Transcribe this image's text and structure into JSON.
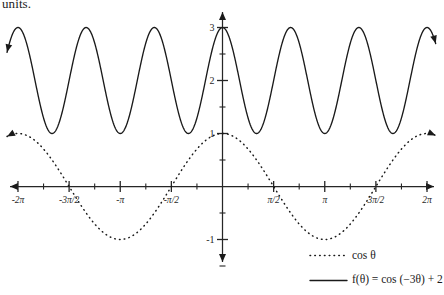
{
  "caption": {
    "text_fragment": "units."
  },
  "chart_data": {
    "type": "line",
    "title": "",
    "xlabel": "",
    "ylabel": "",
    "xlim": [
      -6.283185307179586,
      6.283185307179586
    ],
    "ylim": [
      -1.45,
      3.45
    ],
    "grid": false,
    "legend_position": "bottom-right",
    "x_tick_labels": [
      "-2π",
      "-3π/2",
      "-π",
      "-π/2",
      "π/2",
      "π",
      "3π/2",
      "2π"
    ],
    "x_tick_values": [
      -6.283185307,
      -4.71238898,
      -3.141592654,
      -1.570796327,
      1.570796327,
      3.141592654,
      4.71238898,
      6.283185307
    ],
    "x_minor_tick_values": [
      -5.497787144,
      -3.926990817,
      -2.35619449,
      -0.785398163,
      0.785398163,
      2.35619449,
      3.926990817,
      5.497787144
    ],
    "y_tick_labels": [
      "3",
      "2",
      "1",
      "-1"
    ],
    "y_tick_values": [
      3,
      2,
      1,
      -1
    ],
    "y_minor_tick_values": [
      2.5,
      1.5,
      0.5,
      -0.5,
      -1.5
    ],
    "series": [
      {
        "name": "cos θ",
        "expression": "cos(θ)",
        "style": "dotted",
        "color": "#1a1a1a",
        "amplitude": 1,
        "frequency": 1,
        "vertical_shift": 0,
        "ymin": -1,
        "ymax": 1,
        "period": 6.283185307,
        "key_points": [
          {
            "x": -6.283185307,
            "y": 1
          },
          {
            "x": -4.71238898,
            "y": 0
          },
          {
            "x": -3.141592654,
            "y": -1
          },
          {
            "x": -1.570796327,
            "y": 0
          },
          {
            "x": 0,
            "y": 1
          },
          {
            "x": 1.570796327,
            "y": 0
          },
          {
            "x": 3.141592654,
            "y": -1
          },
          {
            "x": 4.71238898,
            "y": 0
          },
          {
            "x": 6.283185307,
            "y": 1
          }
        ]
      },
      {
        "name": "f(θ) = cos (-3θ) + 2",
        "expression": "cos(-3θ) + 2",
        "style": "solid",
        "color": "#1a1a1a",
        "amplitude": 1,
        "frequency": 3,
        "vertical_shift": 2,
        "ymin": 1,
        "ymax": 3,
        "period": 2.094395102,
        "key_points": [
          {
            "x": -6.283185307,
            "y": 3
          },
          {
            "x": -5.235987756,
            "y": 1
          },
          {
            "x": -4.188790205,
            "y": 3
          },
          {
            "x": -3.141592654,
            "y": 1
          },
          {
            "x": -2.094395102,
            "y": 3
          },
          {
            "x": -1.047197551,
            "y": 1
          },
          {
            "x": 0,
            "y": 3
          },
          {
            "x": 1.047197551,
            "y": 1
          },
          {
            "x": 2.094395102,
            "y": 3
          },
          {
            "x": 3.141592654,
            "y": 1
          },
          {
            "x": 4.188790205,
            "y": 3
          },
          {
            "x": 5.235987756,
            "y": 1
          },
          {
            "x": 6.283185307,
            "y": 3
          }
        ]
      }
    ]
  },
  "legend": {
    "entries": [
      {
        "label": "cos θ",
        "style": "dotted"
      },
      {
        "label": "f(θ) = cos (−3θ) + 2",
        "style": "solid"
      }
    ]
  },
  "axes_geometry": {
    "origin_px": {
      "x": 222.5,
      "y": 186.5
    },
    "x_unit_px": 32.55,
    "y_unit_px": 53.0
  }
}
